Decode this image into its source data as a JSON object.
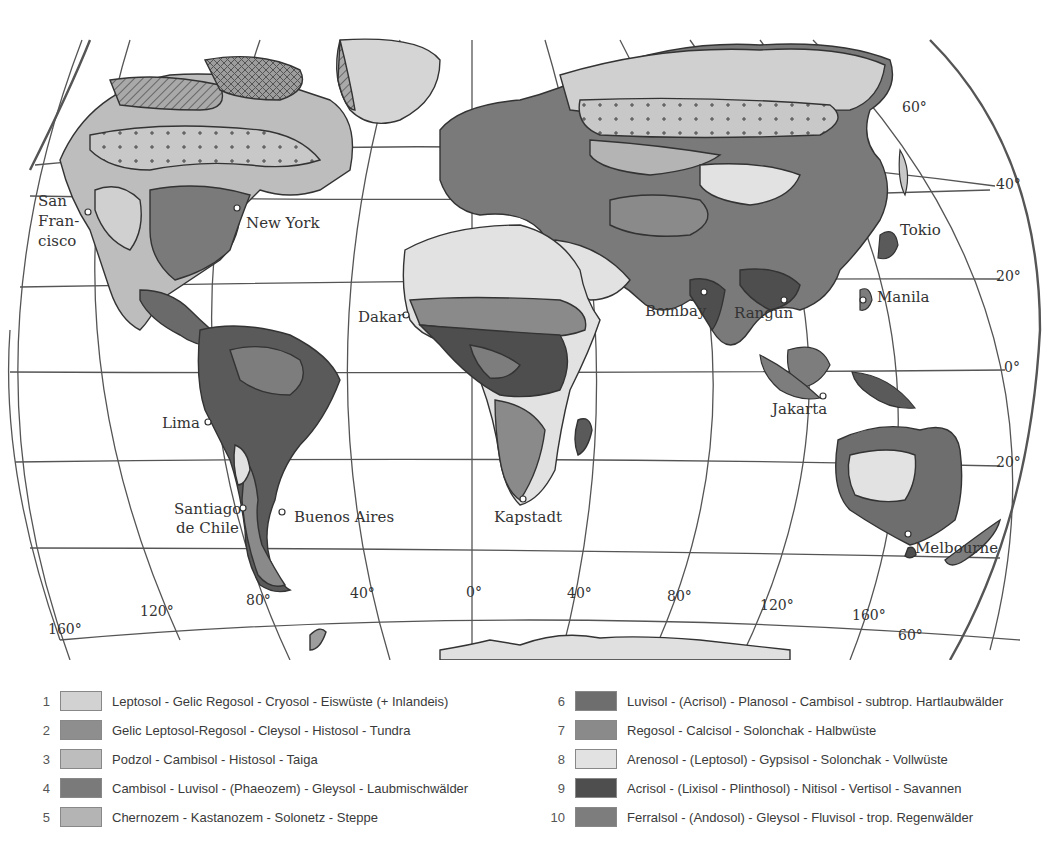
{
  "map": {
    "title": "Soil zones of the world",
    "cities": [
      {
        "name": "San",
        "x": 38,
        "y": 206
      },
      {
        "name": "Fran-",
        "x": 38,
        "y": 226
      },
      {
        "name": "cisco",
        "x": 38,
        "y": 246
      },
      {
        "name": "New York",
        "x": 246,
        "y": 228
      },
      {
        "name": "Dakar",
        "x": 358,
        "y": 322
      },
      {
        "name": "Lima",
        "x": 162,
        "y": 428
      },
      {
        "name": "Santiago",
        "x": 174,
        "y": 514
      },
      {
        "name": "de Chile",
        "x": 176,
        "y": 533
      },
      {
        "name": "Buenos Aires",
        "x": 294,
        "y": 522
      },
      {
        "name": "Kapstadt",
        "x": 494,
        "y": 522
      },
      {
        "name": "Bombay",
        "x": 645,
        "y": 316
      },
      {
        "name": "Rangun",
        "x": 734,
        "y": 318
      },
      {
        "name": "Manila",
        "x": 877,
        "y": 302
      },
      {
        "name": "Jakarta",
        "x": 772,
        "y": 414
      },
      {
        "name": "Tokio",
        "x": 900,
        "y": 235
      },
      {
        "name": "Melbourne",
        "x": 915,
        "y": 553
      }
    ],
    "latitude_labels": [
      {
        "text": "60°",
        "x": 902,
        "y": 112
      },
      {
        "text": "40°",
        "x": 996,
        "y": 189
      },
      {
        "text": "20°",
        "x": 996,
        "y": 281
      },
      {
        "text": "0°",
        "x": 1004,
        "y": 372
      },
      {
        "text": "20°",
        "x": 996,
        "y": 467
      },
      {
        "text": "60°",
        "x": 898,
        "y": 640
      }
    ],
    "longitude_labels": [
      {
        "text": "160°",
        "x": 48,
        "y": 634
      },
      {
        "text": "120°",
        "x": 140,
        "y": 616
      },
      {
        "text": "80°",
        "x": 246,
        "y": 605
      },
      {
        "text": "40°",
        "x": 350,
        "y": 598
      },
      {
        "text": "0°",
        "x": 466,
        "y": 597
      },
      {
        "text": "40°",
        "x": 567,
        "y": 598
      },
      {
        "text": "80°",
        "x": 667,
        "y": 601
      },
      {
        "text": "120°",
        "x": 760,
        "y": 610
      },
      {
        "text": "160°",
        "x": 852,
        "y": 620
      }
    ]
  },
  "legend": {
    "left": [
      {
        "num": "1",
        "label": "Leptosol - Gelic Regosol - Cryosol - Eiswüste (+ Inlandeis)",
        "color": "#d2d2d2"
      },
      {
        "num": "2",
        "label": "Gelic Leptosol-Regosol - Cleysol - Histosol - Tundra",
        "color": "#8e8e8e"
      },
      {
        "num": "3",
        "label": "Podzol - Cambisol - Histosol - Taiga",
        "color": "#bdbdbd"
      },
      {
        "num": "4",
        "label": "Cambisol - Luvisol - (Phaeozem) - Gleysol - Laubmischwälder",
        "color": "#7a7a7a"
      },
      {
        "num": "5",
        "label": "Chernozem - Kastanozem - Solonetz - Steppe",
        "color": "#b4b4b4"
      }
    ],
    "right": [
      {
        "num": "6",
        "label": "Luvisol - (Acrisol) - Planosol - Cambisol - subtrop. Hartlaubwälder",
        "color": "#6e6e6e"
      },
      {
        "num": "7",
        "label": "Regosol - Calcisol - Solonchak - Halbwüste",
        "color": "#8a8a8a"
      },
      {
        "num": "8",
        "label": "Arenosol - (Leptosol) - Gypsisol - Solonchak - Vollwüste",
        "color": "#e2e2e2"
      },
      {
        "num": "9",
        "label": "Acrisol - (Lixisol - Plinthosol) - Nitisol - Vertisol - Savannen",
        "color": "#4e4e4e"
      },
      {
        "num": "10",
        "label": "Ferralsol - (Andosol) - Gleysol - Fluvisol - trop. Regenwälder",
        "color": "#7d7d7d"
      }
    ]
  }
}
